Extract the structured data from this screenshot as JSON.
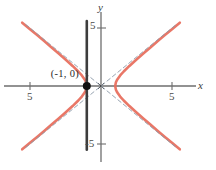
{
  "figure": {
    "background": "#ffffff",
    "curve_color": "#e8705f",
    "asymptote_color": "#8c9aa8",
    "axis_color": "#6e6e6e",
    "accent_line_color": "#3d3d3d",
    "point_color": "#111111"
  },
  "axes": {
    "x_label": "x",
    "y_label": "y",
    "x_ticks": [
      {
        "value": -5,
        "label": "5"
      },
      {
        "value": 5,
        "label": "5"
      }
    ],
    "y_ticks": [
      {
        "value": 5,
        "label": "5"
      },
      {
        "value": -5,
        "label": "-5"
      }
    ],
    "xlim": [
      -7.2,
      7.2
    ],
    "ylim": [
      -6.0,
      6.0
    ]
  },
  "annotations": [
    {
      "name": "vertex-label",
      "text": "(-1, 0)",
      "x": -3.4,
      "y": 0.85
    }
  ],
  "markers": [
    {
      "name": "vertex-point",
      "x": -1,
      "y": 0,
      "radius": 4
    }
  ],
  "chart_data": {
    "type": "line",
    "title": "",
    "xlabel": "x",
    "ylabel": "y",
    "xlim": [
      -7.2,
      7.2
    ],
    "ylim": [
      -6.0,
      6.0
    ],
    "grid": false,
    "legend": null,
    "series": [
      {
        "name": "hyperbola-left-branch",
        "equation": "x^2 - y^2 = 1, x <= -1",
        "color": "#e8705f",
        "style": "solid",
        "points": [
          [
            -5.55,
            -5.46
          ],
          [
            -5.0,
            -4.9
          ],
          [
            -4.5,
            -4.39
          ],
          [
            -4.0,
            -3.87
          ],
          [
            -3.5,
            -3.35
          ],
          [
            -3.0,
            -2.83
          ],
          [
            -2.5,
            -2.29
          ],
          [
            -2.0,
            -1.73
          ],
          [
            -1.6,
            -1.25
          ],
          [
            -1.35,
            -0.91
          ],
          [
            -1.15,
            -0.57
          ],
          [
            -1.05,
            -0.32
          ],
          [
            -1.0,
            0.0
          ],
          [
            -1.05,
            0.32
          ],
          [
            -1.15,
            0.57
          ],
          [
            -1.35,
            0.91
          ],
          [
            -1.6,
            1.25
          ],
          [
            -2.0,
            1.73
          ],
          [
            -2.5,
            2.29
          ],
          [
            -3.0,
            2.83
          ],
          [
            -3.5,
            3.35
          ],
          [
            -4.0,
            3.87
          ],
          [
            -4.5,
            4.39
          ],
          [
            -5.0,
            4.9
          ],
          [
            -5.55,
            5.46
          ]
        ]
      },
      {
        "name": "hyperbola-right-branch",
        "equation": "x^2 - y^2 = 1, x >= 1",
        "color": "#e8705f",
        "style": "solid",
        "points": [
          [
            5.55,
            -5.46
          ],
          [
            5.0,
            -4.9
          ],
          [
            4.5,
            -4.39
          ],
          [
            4.0,
            -3.87
          ],
          [
            3.5,
            -3.35
          ],
          [
            3.0,
            -2.83
          ],
          [
            2.5,
            -2.29
          ],
          [
            2.0,
            -1.73
          ],
          [
            1.6,
            -1.25
          ],
          [
            1.35,
            -0.91
          ],
          [
            1.15,
            -0.57
          ],
          [
            1.05,
            -0.32
          ],
          [
            1.0,
            0.0
          ],
          [
            1.05,
            0.32
          ],
          [
            1.15,
            0.57
          ],
          [
            1.35,
            0.91
          ],
          [
            1.6,
            1.25
          ],
          [
            2.0,
            1.73
          ],
          [
            2.5,
            2.29
          ],
          [
            3.0,
            2.83
          ],
          [
            3.5,
            3.35
          ],
          [
            4.0,
            3.87
          ],
          [
            4.5,
            4.39
          ],
          [
            5.0,
            4.9
          ],
          [
            5.55,
            5.46
          ]
        ]
      },
      {
        "name": "asymptote-positive-slope",
        "equation": "y = x",
        "color": "#8c9aa8",
        "style": "dashed",
        "points": [
          [
            -5.3,
            -5.3
          ],
          [
            5.3,
            5.3
          ]
        ]
      },
      {
        "name": "asymptote-negative-slope",
        "equation": "y = -x",
        "color": "#8c9aa8",
        "style": "dashed",
        "points": [
          [
            -5.3,
            5.3
          ],
          [
            5.3,
            -5.3
          ]
        ]
      },
      {
        "name": "vertical-accent-line",
        "equation": "x = -1",
        "color": "#3d3d3d",
        "style": "solid-thick",
        "points": [
          [
            -1,
            -5.5
          ],
          [
            -1,
            5.6
          ]
        ]
      }
    ]
  }
}
